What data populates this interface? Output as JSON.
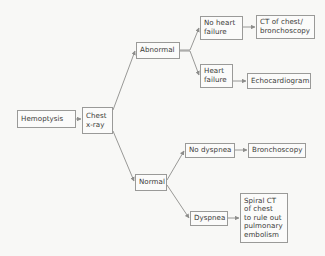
{
  "diagram": {
    "type": "flowchart",
    "background_color": "#f8f8f6",
    "box_border_color": "#9a9a98",
    "box_fill_color": "#fbfbfa",
    "text_color": "#3a3a38",
    "connector_color": "#8d8d8b",
    "nodes": [
      {
        "id": "hemoptysis",
        "label": "Hemoptysis",
        "x": 17,
        "y": 110,
        "w": 59,
        "h": 18
      },
      {
        "id": "chest-xray",
        "label": "Chest\nx-ray",
        "x": 82,
        "y": 107,
        "w": 31,
        "h": 27
      },
      {
        "id": "abnormal",
        "label": "Abnormal",
        "x": 136,
        "y": 42,
        "w": 44,
        "h": 17
      },
      {
        "id": "no-heart-failure",
        "label": "No heart\nfailure",
        "x": 200,
        "y": 16,
        "w": 43,
        "h": 24
      },
      {
        "id": "ct-chest-bronchoscopy",
        "label": "CT of chest/\nbronchoscopy",
        "x": 256,
        "y": 15,
        "w": 59,
        "h": 24
      },
      {
        "id": "heart-failure",
        "label": "Heart\nfailure",
        "x": 200,
        "y": 64,
        "w": 33,
        "h": 24
      },
      {
        "id": "echocardiogram",
        "label": "Echocardiogram",
        "x": 247,
        "y": 73,
        "w": 64,
        "h": 16
      },
      {
        "id": "normal",
        "label": "Normal",
        "x": 135,
        "y": 174,
        "w": 32,
        "h": 17
      },
      {
        "id": "no-dyspnea",
        "label": "No dyspnea",
        "x": 185,
        "y": 143,
        "w": 50,
        "h": 15
      },
      {
        "id": "bronchoscopy",
        "label": "Bronchoscopy",
        "x": 248,
        "y": 143,
        "w": 58,
        "h": 15
      },
      {
        "id": "dyspnea",
        "label": "Dyspnea",
        "x": 190,
        "y": 211,
        "w": 38,
        "h": 15
      },
      {
        "id": "spiral-ct",
        "label": "Spiral CT\nof chest\nto rule out\npulmonary\nembolism",
        "x": 240,
        "y": 193,
        "w": 48,
        "h": 50
      }
    ],
    "edges": [
      {
        "id": "hemoptysis-to-chest-xray",
        "from": "hemoptysis",
        "to": "chest-xray"
      },
      {
        "id": "chest-xray-to-abnormal",
        "from": "chest-xray",
        "to": "abnormal"
      },
      {
        "id": "chest-xray-to-normal",
        "from": "chest-xray",
        "to": "normal"
      },
      {
        "id": "abnormal-to-no-heart-failure",
        "from": "abnormal",
        "to": "no-heart-failure"
      },
      {
        "id": "abnormal-to-heart-failure",
        "from": "abnormal",
        "to": "heart-failure"
      },
      {
        "id": "no-heart-failure-to-ct",
        "from": "no-heart-failure",
        "to": "ct-chest-bronchoscopy"
      },
      {
        "id": "heart-failure-to-echocardiogram",
        "from": "heart-failure",
        "to": "echocardiogram"
      },
      {
        "id": "normal-to-no-dyspnea",
        "from": "normal",
        "to": "no-dyspnea"
      },
      {
        "id": "normal-to-dyspnea",
        "from": "normal",
        "to": "dyspnea"
      },
      {
        "id": "no-dyspnea-to-bronchoscopy",
        "from": "no-dyspnea",
        "to": "bronchoscopy"
      },
      {
        "id": "dyspnea-to-spiral-ct",
        "from": "dyspnea",
        "to": "spiral-ct"
      }
    ]
  }
}
